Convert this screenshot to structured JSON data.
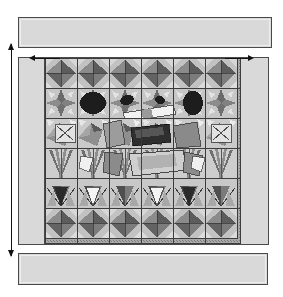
{
  "drawing": {
    "title": "Decorative mosaic panel elevation",
    "description": "Grayscale orthographic elevation of a tiled mosaic frieze panel set between plain upper and lower courses, with overall height and width dimension arrows.",
    "background_color": "#ffffff",
    "canvas": {
      "width": 283,
      "height": 297
    }
  },
  "palette": {
    "plain_band_fill": "#d9d9d9",
    "jamb_fill": "#d9d9d9",
    "outline": "#4a4a4a",
    "annotation": "#111111",
    "mosaic_ground": "#b9b9b9",
    "tile_light": "#e8e8e8",
    "tile_white": "#f6f6f6",
    "tile_midlight": "#c9c9c9",
    "tile_mid": "#a3a3a3",
    "tile_middark": "#7e7e7e",
    "tile_dark": "#585858",
    "tile_darkest": "#2b2b2b",
    "grout": "#3c3c3c"
  },
  "elements": {
    "band_top": {
      "name": "upper plain course",
      "fill": "#d9d9d9"
    },
    "band_bottom": {
      "name": "lower plain course",
      "fill": "#d9d9d9"
    },
    "jamb_left": {
      "name": "left plain jamb",
      "fill": "#d9d9d9"
    },
    "jamb_right": {
      "name": "right plain jamb",
      "fill": "#d9d9d9"
    },
    "mosaic_field": {
      "name": "mosaic tile field",
      "rows": 6,
      "columns": 6
    }
  },
  "annotations": {
    "height_dimension": {
      "name": "overall height dimension",
      "orientation": "vertical",
      "arrow_style": "double-headed",
      "label": ""
    },
    "width_dimension_left": {
      "name": "width dimension left arrow",
      "orientation": "horizontal",
      "arrow_style": "left-pointing",
      "label": ""
    },
    "width_dimension_right": {
      "name": "width dimension right arrow",
      "orientation": "horizontal",
      "arrow_style": "right-pointing",
      "label": ""
    }
  },
  "mosaic_rows": [
    {
      "index": 0,
      "motif": "fan / shell rosettes",
      "tone": "dark"
    },
    {
      "index": 1,
      "motif": "starburst rosettes with dark ovoid centers",
      "tone": "mixed"
    },
    {
      "index": 2,
      "motif": "angular shards and diagonal bands",
      "tone": "mixed"
    },
    {
      "index": 3,
      "motif": "reed and blade clusters",
      "tone": "light"
    },
    {
      "index": 4,
      "motif": "tulip / bud forms",
      "tone": "mixed"
    },
    {
      "index": 5,
      "motif": "fan / shell rosettes",
      "tone": "dark"
    }
  ]
}
